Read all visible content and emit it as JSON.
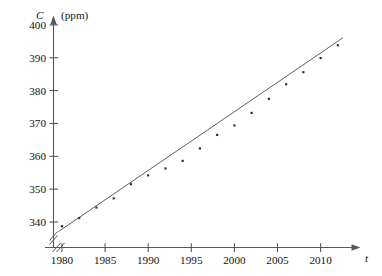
{
  "chart_data": {
    "type": "scatter",
    "title": "",
    "subtitle": "",
    "xlabel": "t",
    "ylabel": "C",
    "ylabel_units": "(ppm)",
    "xlim": [
      1978,
      2013.5
    ],
    "ylim": [
      333,
      402
    ],
    "y_axis_break": true,
    "x_axis_break": true,
    "grid": false,
    "legend": "none",
    "x_ticks": [
      1980,
      1985,
      1990,
      1995,
      2000,
      2005,
      2010
    ],
    "x_tick_labels": [
      "1980",
      "1985",
      "1990",
      "1995",
      "2000",
      "2005",
      "2010"
    ],
    "y_ticks": [
      340,
      350,
      360,
      370,
      380,
      390,
      400
    ],
    "y_tick_labels": [
      "340",
      "350",
      "360",
      "370",
      "380",
      "390",
      "400"
    ],
    "series": [
      {
        "name": "CO2 concentration",
        "marker": "dot",
        "x": [
          1980,
          1982,
          1984,
          1986,
          1988,
          1990,
          1992,
          1994,
          1996,
          1998,
          2000,
          2002,
          2004,
          2006,
          2008,
          2010,
          2012
        ],
        "y": [
          338.7,
          341.2,
          344.4,
          347.2,
          351.5,
          354.2,
          356.3,
          358.6,
          362.4,
          366.5,
          369.4,
          373.2,
          377.5,
          381.9,
          385.6,
          389.9,
          393.8
        ]
      }
    ],
    "fit_line": {
      "name": "linear regression",
      "x": [
        1979.6,
        2012.6
      ],
      "y": [
        337.1,
        396.1
      ]
    }
  },
  "axis": {
    "y_title_symbol": "C",
    "y_title_units": "(ppm)",
    "x_title_symbol": "t"
  },
  "colors": {
    "axis": "#555a5e",
    "point": "#2e3236",
    "line": "#5b6166",
    "text": "#111417",
    "background": "#ffffff"
  }
}
